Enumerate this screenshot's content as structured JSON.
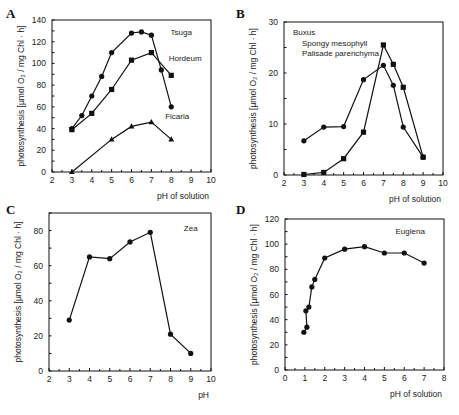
{
  "chart_data": [
    {
      "panel": "A",
      "type": "line",
      "title": "",
      "xlabel": "pH of solution",
      "ylabel": "photosynthesis [µmol O₂ / mg Chl · h]",
      "xlim": [
        2,
        10
      ],
      "ylim": [
        0,
        140
      ],
      "xticks": [
        2,
        3,
        4,
        5,
        6,
        7,
        8,
        9,
        10
      ],
      "yticks": [
        0,
        20,
        40,
        60,
        80,
        100,
        120,
        140
      ],
      "grid": false,
      "series": [
        {
          "name": "Tsuga",
          "marker": "circle",
          "label_pos": [
            8.5,
            126
          ],
          "x": [
            3,
            3.5,
            4,
            4.5,
            5,
            6,
            6.5,
            7,
            7.5,
            8
          ],
          "values": [
            40,
            52,
            70,
            88,
            110,
            128,
            129,
            126,
            94,
            60
          ]
        },
        {
          "name": "Hordeum",
          "marker": "square",
          "label_pos": [
            8.7,
            102
          ],
          "x": [
            3,
            4,
            5,
            6,
            7,
            8
          ],
          "values": [
            39,
            54,
            76,
            103,
            110,
            89
          ]
        },
        {
          "name": "Ficaria",
          "marker": "triangle",
          "label_pos": [
            8.3,
            49
          ],
          "x": [
            3,
            5,
            6,
            7,
            8
          ],
          "values": [
            0,
            30,
            42,
            46,
            30
          ]
        }
      ]
    },
    {
      "panel": "B",
      "type": "line",
      "title": "",
      "xlabel": "pH of solution",
      "ylabel": "photosynthesis [µmol O₂ / mg Chl · h]",
      "xlim": [
        2,
        10
      ],
      "ylim": [
        0,
        30
      ],
      "xticks": [
        2,
        3,
        4,
        5,
        6,
        7,
        8,
        9,
        10
      ],
      "yticks": [
        0,
        10,
        20,
        30
      ],
      "grid": false,
      "legend": {
        "title": "Buxus",
        "entries": [
          "Spongy mesophyll",
          "Palisade parenchyma"
        ],
        "position": "upper left"
      },
      "series": [
        {
          "name": "Spongy mesophyll",
          "marker": "circle",
          "x": [
            3,
            4,
            5,
            6,
            7,
            7.5,
            8,
            9
          ],
          "values": [
            6.7,
            9.4,
            9.5,
            18.7,
            21.5,
            17.6,
            9.4,
            3.5
          ]
        },
        {
          "name": "Palisade parenchyma",
          "marker": "square",
          "x": [
            3,
            4,
            5,
            6,
            7,
            7.5,
            8,
            9
          ],
          "values": [
            0.1,
            0.5,
            3.2,
            8.4,
            25.5,
            21.7,
            17.2,
            3.5
          ]
        }
      ]
    },
    {
      "panel": "C",
      "type": "line",
      "title": "",
      "xlabel": "pH",
      "ylabel": "photosynthesis [µmol O₂ / mg Chl · h]",
      "xlim": [
        2,
        10
      ],
      "ylim": [
        0,
        90
      ],
      "xticks": [
        2,
        3,
        4,
        5,
        6,
        7,
        8,
        9,
        10
      ],
      "yticks": [
        0,
        20,
        40,
        60,
        80
      ],
      "grid": false,
      "series": [
        {
          "name": "Zea",
          "marker": "circle",
          "label_pos": [
            9.0,
            80
          ],
          "x": [
            3,
            4,
            5,
            6,
            7,
            8,
            9
          ],
          "values": [
            29,
            65,
            64,
            73.5,
            79,
            21,
            10
          ]
        }
      ]
    },
    {
      "panel": "D",
      "type": "line",
      "title": "",
      "xlabel": "pH of solution",
      "ylabel": "photosynthesis [µmol O₂ / mg Chl · h]",
      "xlim": [
        0,
        8
      ],
      "ylim": [
        0,
        120
      ],
      "xticks": [
        0,
        1,
        2,
        3,
        4,
        5,
        6,
        7,
        8
      ],
      "yticks": [
        0,
        20,
        40,
        60,
        80,
        100,
        120
      ],
      "grid": false,
      "series": [
        {
          "name": "Euglena",
          "marker": "circle",
          "label_pos": [
            6.3,
            108
          ],
          "x": [
            0.95,
            1.1,
            1.05,
            1.2,
            1.35,
            1.5,
            2,
            3,
            4,
            5,
            6,
            7
          ],
          "values": [
            30,
            34,
            47,
            50,
            66,
            72,
            89,
            96,
            98,
            93,
            93,
            85
          ]
        }
      ]
    }
  ],
  "layout": {
    "panels": [
      {
        "letter": "A",
        "letter_pos": [
          6,
          18
        ],
        "frame": [
          52,
          20,
          211,
          172
        ]
      },
      {
        "letter": "B",
        "letter_pos": [
          236,
          18
        ],
        "frame": [
          284,
          22,
          443,
          175
        ]
      },
      {
        "letter": "C",
        "letter_pos": [
          6,
          214
        ],
        "frame": [
          49,
          213,
          211,
          371
        ]
      },
      {
        "letter": "D",
        "letter_pos": [
          236,
          214
        ],
        "frame": [
          285,
          219,
          444,
          370
        ]
      }
    ]
  }
}
